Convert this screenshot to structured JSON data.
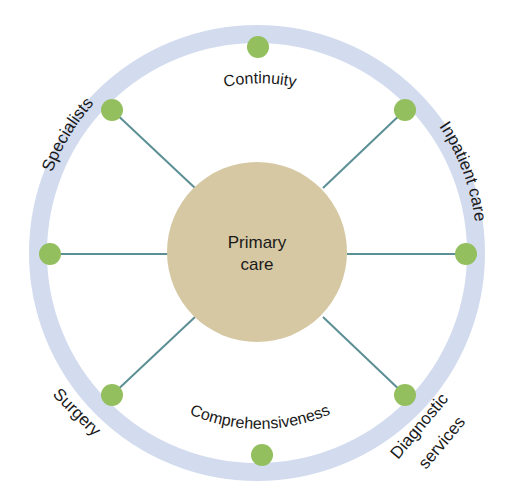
{
  "diagram": {
    "center": {
      "line1": "Primary",
      "line2": "care"
    },
    "outer_labels": {
      "specialists": "Specialists",
      "inpatient_care": "Inpatient care",
      "surgery": "Surgery",
      "diagnostic_line1": "Diagnostic",
      "diagnostic_line2": "services"
    },
    "inner_labels": {
      "continuity": "Continuity",
      "comprehensiveness": "Comprehensiveness"
    },
    "colors": {
      "ring": "#d3dcef",
      "node": "#93bf5e",
      "center_fill": "#d6c8a3",
      "spoke": "#5b8f94",
      "text": "#1a1a1a"
    }
  }
}
